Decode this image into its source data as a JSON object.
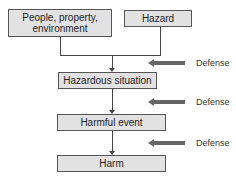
{
  "diagram": {
    "title": "",
    "nodes": [
      {
        "id": "people",
        "label": "People, property, environment"
      },
      {
        "id": "hazard",
        "label": "Hazard"
      },
      {
        "id": "hazardous_situation",
        "label": "Hazardous situation"
      },
      {
        "id": "harmful_event",
        "label": "Harmful event"
      },
      {
        "id": "harm",
        "label": "Harm"
      }
    ],
    "edges": [
      {
        "from": "people",
        "to": "hazardous_situation"
      },
      {
        "from": "hazard",
        "to": "hazardous_situation"
      },
      {
        "from": "hazardous_situation",
        "to": "harmful_event"
      },
      {
        "from": "harmful_event",
        "to": "harm"
      }
    ],
    "defenses": [
      {
        "label": "Defense",
        "acts_on": "people+hazard -> hazardous_situation"
      },
      {
        "label": "Defense",
        "acts_on": "hazardous_situation -> harmful_event"
      },
      {
        "label": "Defense",
        "acts_on": "harmful_event -> harm"
      }
    ],
    "colors": {
      "box_fill": "#e2e2e2",
      "box_border": "#555555",
      "defense_arrow": "#666666"
    }
  }
}
